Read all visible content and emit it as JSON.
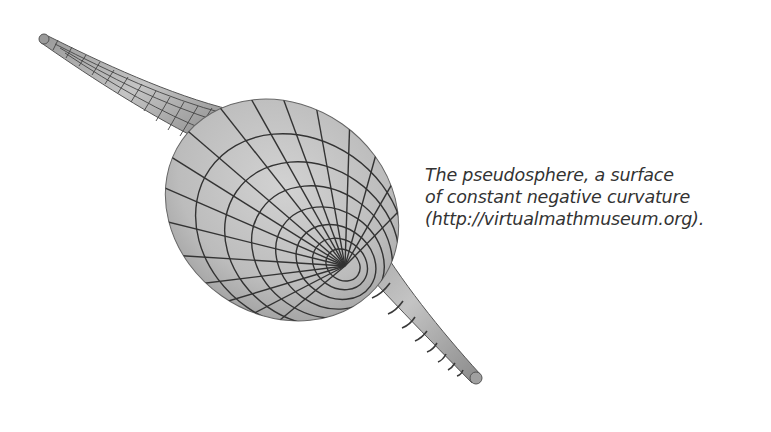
{
  "figure": {
    "colors": {
      "surface": "#bdbdbd",
      "grid": "#3a3a3a",
      "background": "#ffffff"
    }
  },
  "caption": {
    "lines": [
      "The pseudosphere, a surface",
      "of constant negative curvature",
      "(http://virtualmathmuseum.org)."
    ]
  }
}
